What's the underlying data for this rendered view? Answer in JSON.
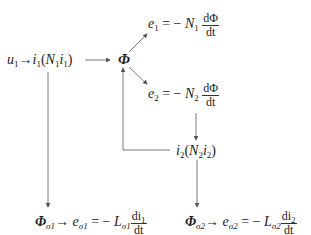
{
  "diagram": {
    "nodes": {
      "input": {
        "u": "u",
        "u_sub": "1",
        "arrow": "→",
        "i": "i",
        "i_sub": "1",
        "paren_open": "(",
        "N": "N",
        "N_sub": "1",
        "i2": "i",
        "i2_sub": "1",
        "paren_close": ")"
      },
      "phi": {
        "symbol": "Φ"
      },
      "e1": {
        "e": "e",
        "e_sub": "1",
        "eq": "= −",
        "N": "N",
        "N_sub": "1",
        "num": "dΦ",
        "den": "dt"
      },
      "e2": {
        "e": "e",
        "e_sub": "2",
        "eq": "= −",
        "N": "N",
        "N_sub": "2",
        "num": "dΦ",
        "den": "dt"
      },
      "i2node": {
        "i": "i",
        "i_sub": "2",
        "paren_open": "(",
        "N": "N",
        "N_sub": "2",
        "i2": "i",
        "i2_sub": "2",
        "paren_close": ")"
      },
      "leak1": {
        "phi": "Φ",
        "phi_sub": "σ1",
        "arrow": "→",
        "e": "e",
        "e_sub": "σ1",
        "eq": "= −",
        "L": "L",
        "L_sub": "σ1",
        "num": "di",
        "num_sub": "1",
        "den": "dt"
      },
      "leak2": {
        "phi": "Φ",
        "phi_sub": "σ2",
        "arrow": "→",
        "e": "e",
        "e_sub": "σ2",
        "eq": "= −",
        "L": "L",
        "L_sub": "σ2",
        "num": "di",
        "num_sub": "2",
        "den": "dt"
      }
    },
    "colors": {
      "line": "#555555",
      "text": "#222222",
      "background": "#ffffff"
    }
  }
}
